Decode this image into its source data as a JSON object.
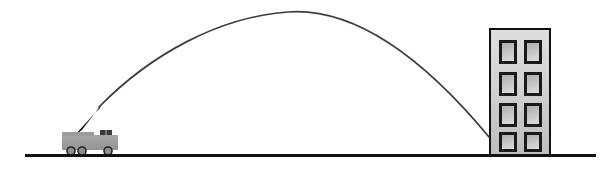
{
  "diagram": {
    "type": "physics-illustration",
    "canvas": {
      "width": 615,
      "height": 171,
      "background": "#ffffff"
    },
    "ground": {
      "label": "ground-line",
      "x1": 25,
      "y1": 155,
      "x2": 596,
      "y2": 155,
      "thickness": 3,
      "color": "#111111"
    },
    "trajectory": {
      "label": "projectile-path",
      "shape": "parabolic-arc",
      "color": "#3d3d3d",
      "thickness": 1.7,
      "launch_point": {
        "x": 99,
        "y": 107
      },
      "apex": {
        "x": 288,
        "y": 12
      },
      "impact_point": {
        "x": 489,
        "y": 137
      },
      "path": "M 99 107 C 150 55, 218 17, 288 12 C 360 7, 430 66, 489 137"
    },
    "truck": {
      "label": "cannon-truck",
      "body_color": "#9c9c9c",
      "body_outline": "#6f6f6f",
      "wheel_color": "#8a8a8a",
      "wheel_outline": "#222222",
      "barrel_color": "#151515",
      "body": {
        "x": 62,
        "y": 135,
        "width": 56,
        "height": 15
      },
      "cab": {
        "x": 100,
        "y": 130,
        "width": 12,
        "height": 6
      },
      "barrel": {
        "base_x": 76,
        "base_y": 135,
        "tip_x": 100,
        "tip_y": 106
      },
      "wheels": [
        {
          "cx": 71,
          "cy": 151,
          "r": 4
        },
        {
          "cx": 82,
          "cy": 151,
          "r": 4
        },
        {
          "cx": 108,
          "cy": 151,
          "r": 4
        }
      ]
    },
    "building": {
      "label": "target-building",
      "x": 489,
      "y": 28,
      "width": 62,
      "height": 128,
      "wall_fill_top": "#d9d9d9",
      "wall_fill_bottom": "#bdbdbd",
      "outline": "#111111",
      "outline_width": 2,
      "window_rows": 4,
      "window_cols": 2,
      "window_border": "#1a1a1a",
      "window_border_width": 3,
      "window_fill_top": "#b4b4b4",
      "window_fill_bottom": "#d2d2d2",
      "windows": [
        {
          "x": 499,
          "y": 40,
          "width": 18,
          "height": 24
        },
        {
          "x": 524,
          "y": 40,
          "width": 18,
          "height": 24
        },
        {
          "x": 499,
          "y": 72,
          "width": 18,
          "height": 24
        },
        {
          "x": 524,
          "y": 72,
          "width": 18,
          "height": 24
        },
        {
          "x": 499,
          "y": 103,
          "width": 18,
          "height": 24
        },
        {
          "x": 524,
          "y": 103,
          "width": 18,
          "height": 24
        },
        {
          "x": 499,
          "y": 132,
          "width": 18,
          "height": 20
        },
        {
          "x": 524,
          "y": 132,
          "width": 18,
          "height": 20
        }
      ]
    }
  }
}
